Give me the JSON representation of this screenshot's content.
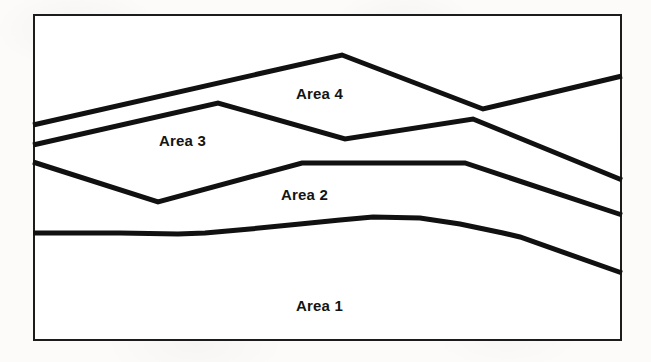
{
  "figure": {
    "kind": "area-band-diagram",
    "frame": {
      "x": 33,
      "y": 14,
      "width": 589,
      "height": 327
    },
    "border_color": "#1c1c1c",
    "plot_background": "#ffffff",
    "page_background": "#fcfbfa",
    "line_color": "#111111",
    "line_width": 5
  },
  "labels": {
    "area1": "Area 1",
    "area2": "Area 2",
    "area3": "Area 3",
    "area4": "Area 4"
  },
  "chart_data": {
    "type": "area",
    "title": "",
    "xlabel": "",
    "ylabel": "",
    "grid": false,
    "legend": "inline-region-labels",
    "axis_ticks": false,
    "note": "Four stacked boundary curves partition the white plot rectangle into four regions labelled Area 1 (bottom) through Area 4 (top). Coordinates are in screenshot pixel space; y increases downward.",
    "xlim": [
      33,
      622
    ],
    "ylim": [
      341,
      14
    ],
    "series": [
      {
        "name": "Area 1",
        "label": "Area 1",
        "label_position": {
          "x": 296,
          "y": 298
        },
        "boundary": "top edge of Area 1",
        "points": [
          [
            33,
            233
          ],
          [
            120,
            233
          ],
          [
            178,
            234
          ],
          [
            205,
            233
          ],
          [
            250,
            229
          ],
          [
            300,
            224
          ],
          [
            340,
            220
          ],
          [
            373,
            217
          ],
          [
            420,
            218
          ],
          [
            460,
            224
          ],
          [
            503,
            233
          ],
          [
            520,
            237
          ],
          [
            622,
            273
          ]
        ]
      },
      {
        "name": "Area 2",
        "label": "Area 2",
        "label_position": {
          "x": 281,
          "y": 187
        },
        "boundary": "top edge of Area 2",
        "points": [
          [
            33,
            162
          ],
          [
            158,
            202
          ],
          [
            302,
            163
          ],
          [
            465,
            163
          ],
          [
            622,
            215
          ]
        ]
      },
      {
        "name": "Area 3",
        "label": "Area 3",
        "label_position": {
          "x": 159,
          "y": 133
        },
        "boundary": "top edge of Area 3",
        "points": [
          [
            33,
            145
          ],
          [
            218,
            103
          ],
          [
            345,
            139
          ],
          [
            473,
            119
          ],
          [
            622,
            180
          ]
        ]
      },
      {
        "name": "Area 4",
        "label": "Area 4",
        "label_position": {
          "x": 296,
          "y": 86
        },
        "boundary": "top edge of Area 4",
        "points": [
          [
            33,
            125
          ],
          [
            342,
            55
          ],
          [
            483,
            109
          ],
          [
            622,
            76
          ]
        ]
      }
    ]
  }
}
